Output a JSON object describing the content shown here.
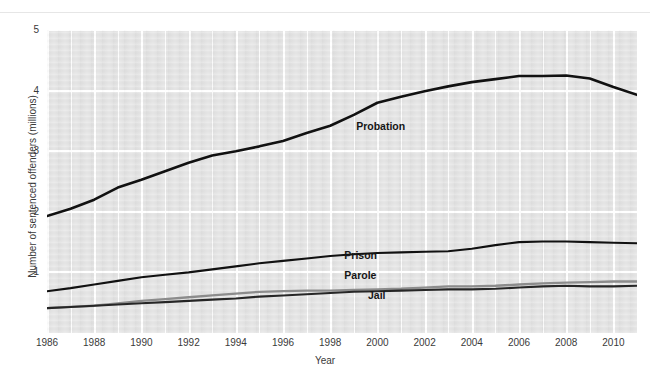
{
  "chart_data": {
    "type": "line",
    "title": "",
    "xlabel": "Year",
    "ylabel": "Number of sentenced offenders (millions)",
    "xlim": [
      1986,
      2011
    ],
    "ylim": [
      0,
      5
    ],
    "yticks": [
      1,
      2,
      3,
      4,
      5
    ],
    "xticks": [
      1986,
      1988,
      1990,
      1992,
      1994,
      1996,
      1998,
      2000,
      2002,
      2004,
      2006,
      2008,
      2010
    ],
    "grid": true,
    "legend_position": "inline-labels",
    "background_color": "#e3e3e3",
    "gridline_color": "#ffffff",
    "x": [
      1986,
      1987,
      1988,
      1989,
      1990,
      1991,
      1992,
      1993,
      1994,
      1995,
      1996,
      1997,
      1998,
      1999,
      2000,
      2001,
      2002,
      2003,
      2004,
      2005,
      2006,
      2007,
      2008,
      2009,
      2010,
      2011
    ],
    "series": [
      {
        "name": "Probation",
        "color": "#111111",
        "width": 2.6,
        "label_x": 1999.1,
        "label_y": 3.42,
        "values": [
          1.93,
          2.05,
          2.2,
          2.4,
          2.53,
          2.67,
          2.81,
          2.93,
          3.0,
          3.08,
          3.17,
          3.3,
          3.42,
          3.6,
          3.8,
          3.9,
          3.99,
          4.07,
          4.14,
          4.19,
          4.24,
          4.24,
          4.25,
          4.2,
          4.06,
          3.93
        ]
      },
      {
        "name": "Prison",
        "color": "#111111",
        "width": 2.1,
        "label_x": 1998.6,
        "label_y": 1.28,
        "values": [
          0.69,
          0.74,
          0.8,
          0.86,
          0.92,
          0.96,
          1.0,
          1.05,
          1.1,
          1.15,
          1.19,
          1.23,
          1.27,
          1.3,
          1.32,
          1.33,
          1.34,
          1.35,
          1.39,
          1.45,
          1.5,
          1.51,
          1.51,
          1.5,
          1.49,
          1.48
        ]
      },
      {
        "name": "Parole",
        "color": "#8c8c8c",
        "width": 2.3,
        "label_x": 1998.6,
        "label_y": 0.95,
        "values": [
          0.41,
          0.43,
          0.45,
          0.49,
          0.53,
          0.56,
          0.59,
          0.62,
          0.65,
          0.68,
          0.69,
          0.7,
          0.7,
          0.71,
          0.72,
          0.73,
          0.75,
          0.77,
          0.77,
          0.78,
          0.8,
          0.82,
          0.83,
          0.84,
          0.85,
          0.85
        ]
      },
      {
        "name": "Jail",
        "color": "#262626",
        "width": 2.1,
        "label_x": 1999.6,
        "label_y": 0.63,
        "values": [
          0.41,
          0.43,
          0.45,
          0.47,
          0.49,
          0.51,
          0.53,
          0.55,
          0.57,
          0.6,
          0.62,
          0.64,
          0.66,
          0.68,
          0.69,
          0.7,
          0.71,
          0.72,
          0.72,
          0.73,
          0.75,
          0.77,
          0.78,
          0.77,
          0.77,
          0.78
        ]
      }
    ]
  }
}
